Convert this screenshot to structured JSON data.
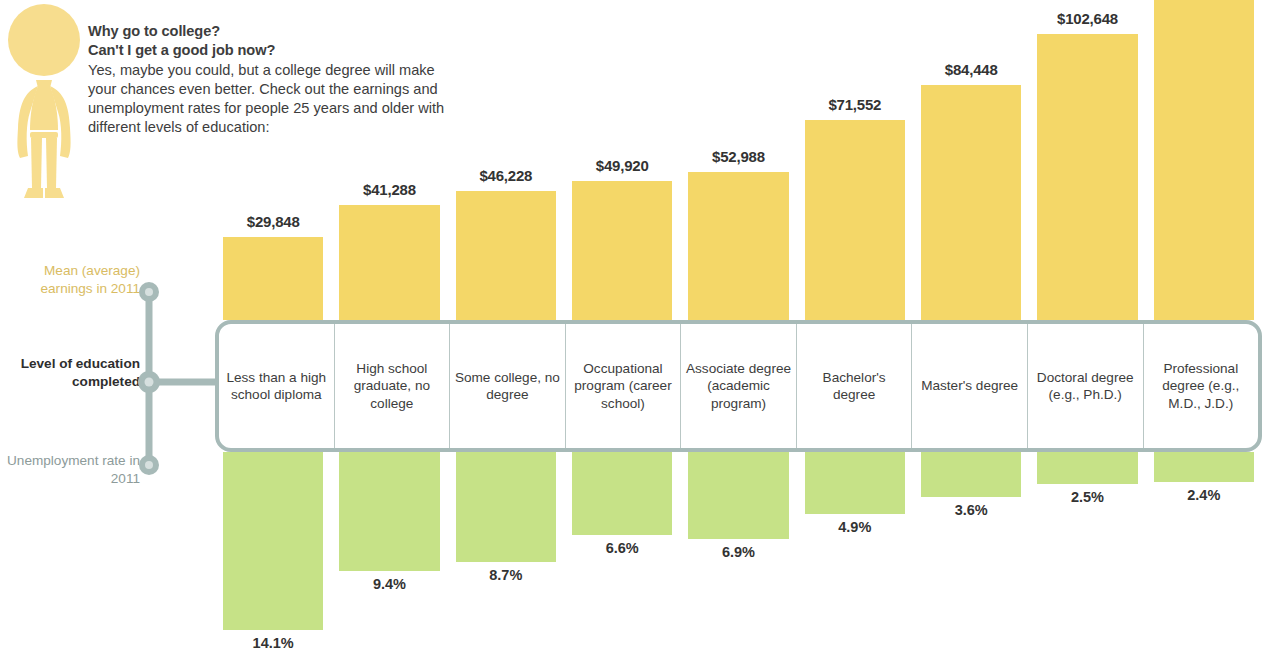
{
  "intro": {
    "heading_line1": "Why go to college?",
    "heading_line2": "Can't I get a good job now?",
    "body": "Yes, maybe you could, but a college degree will make your chances even better. Check out the earnings and unemployment rates for people 25 years and older with different levels of education:",
    "figure_icon": "person-figure-icon"
  },
  "axis": {
    "earnings_label": "Mean (average) earnings in 2011",
    "level_label": "Level of education completed",
    "unemployment_label": "Unemployment rate in 2011"
  },
  "colors": {
    "earnings_bar": "#f4d768",
    "unemployment_bar": "#c6e287",
    "band_border": "#a7bab8",
    "connector": "#a7bab8",
    "earnings_axis_text": "#d9bc63",
    "unemployment_axis_text": "#8d9b9a",
    "figure": "#f7dd8e"
  },
  "chart_data": {
    "type": "bar",
    "xlabel": "Level of education completed",
    "categories": [
      "Less than a high school diploma",
      "High school graduate, no college",
      "Some college, no degree",
      "Occupational program (career school)",
      "Associate degree (academic program)",
      "Bachelor's degree",
      "Master's degree",
      "Doctoral degree (e.g., Ph.D.)",
      "Professional degree (e.g., M.D., J.D.)"
    ],
    "series": [
      {
        "name": "Mean (average) earnings in 2011",
        "direction": "up",
        "color": "#f4d768",
        "unit": "USD",
        "values": [
          29848,
          41288,
          46228,
          49920,
          52988,
          71552,
          84448,
          102648,
          121212
        ],
        "labels": [
          "$29,848",
          "$41,288",
          "$46,228",
          "$49,920",
          "$52,988",
          "$71,552",
          "$84,448",
          "$102,648",
          "$121,212"
        ]
      },
      {
        "name": "Unemployment rate in 2011",
        "direction": "down",
        "color": "#c6e287",
        "unit": "percent",
        "values": [
          14.1,
          9.4,
          8.7,
          6.6,
          6.9,
          4.9,
          3.6,
          2.5,
          2.4
        ],
        "labels": [
          "14.1%",
          "9.4%",
          "8.7%",
          "6.6%",
          "6.9%",
          "4.9%",
          "3.6%",
          "2.5%",
          "2.4%"
        ]
      }
    ],
    "grid": false,
    "legend": "none",
    "note": "Top earnings bar ($121,212) is clipped by the top edge of the image."
  }
}
